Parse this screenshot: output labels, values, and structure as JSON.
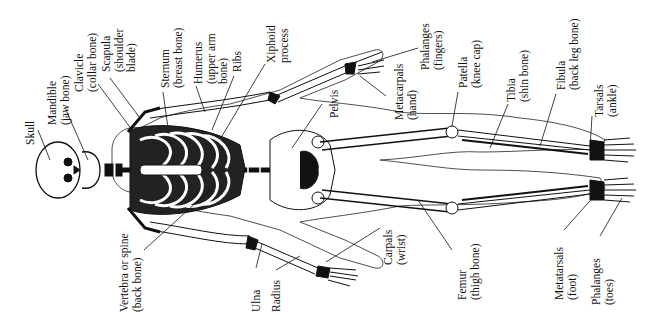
{
  "diagram": {
    "labels": [
      {
        "id": "skull",
        "lines": [
          "Skull"
        ],
        "x": 24,
        "y": 145
      },
      {
        "id": "mandible",
        "lines": [
          "Mandible",
          "(jaw bone)"
        ],
        "x": 46,
        "y": 125
      },
      {
        "id": "clavicle",
        "lines": [
          "Clavicle",
          "(collar bone)"
        ],
        "x": 73,
        "y": 92
      },
      {
        "id": "scapula",
        "lines": [
          "Scapula",
          "(shoulder",
          "blade)"
        ],
        "x": 100,
        "y": 72
      },
      {
        "id": "sternum",
        "lines": [
          "Sternum",
          "(breast bone)"
        ],
        "x": 159,
        "y": 88
      },
      {
        "id": "humerus",
        "lines": [
          "Humerus",
          "(upper arm",
          "bone)"
        ],
        "x": 192,
        "y": 84
      },
      {
        "id": "ribs",
        "lines": [
          "Ribs"
        ],
        "x": 231,
        "y": 72
      },
      {
        "id": "xiphoid",
        "lines": [
          "Xiphoid",
          "process"
        ],
        "x": 265,
        "y": 63
      },
      {
        "id": "pelvis",
        "lines": [
          "Pelvis"
        ],
        "x": 328,
        "y": 118
      },
      {
        "id": "metacarpals",
        "lines": [
          "Metacarpals",
          "(hand)"
        ],
        "x": 393,
        "y": 120
      },
      {
        "id": "phalanges_fingers",
        "lines": [
          "Phalanges",
          "(fingers)"
        ],
        "x": 419,
        "y": 70
      },
      {
        "id": "patella",
        "lines": [
          "Patella",
          "(knee cap)"
        ],
        "x": 457,
        "y": 88
      },
      {
        "id": "tibia",
        "lines": [
          "Tibia",
          "(shin bone)"
        ],
        "x": 505,
        "y": 102
      },
      {
        "id": "fibula",
        "lines": [
          "Fibula",
          "(back leg bone)"
        ],
        "x": 555,
        "y": 90
      },
      {
        "id": "tarsals",
        "lines": [
          "Tarsals",
          "(ankle)"
        ],
        "x": 593,
        "y": 117
      },
      {
        "id": "vertebra",
        "lines": [
          "Vertebra or spine",
          "(back bone)"
        ],
        "x": 118,
        "y": 312
      },
      {
        "id": "ulna",
        "lines": [
          "Ulna"
        ],
        "x": 250,
        "y": 312
      },
      {
        "id": "radius",
        "lines": [
          "Radius"
        ],
        "x": 270,
        "y": 312
      },
      {
        "id": "carpals",
        "lines": [
          "Carpals",
          "(wrist)"
        ],
        "x": 382,
        "y": 265
      },
      {
        "id": "femur",
        "lines": [
          "Femur",
          "(thigh bone)"
        ],
        "x": 456,
        "y": 300
      },
      {
        "id": "metatarsals",
        "lines": [
          "Metatarsals",
          "(foot)"
        ],
        "x": 553,
        "y": 300
      },
      {
        "id": "phalanges_toes",
        "lines": [
          "Phalanges",
          "(toes)"
        ],
        "x": 590,
        "y": 305
      }
    ]
  }
}
